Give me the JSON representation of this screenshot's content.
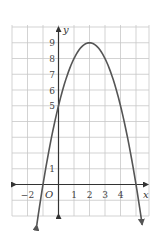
{
  "chart_data": {
    "type": "line",
    "title": "",
    "xlabel": "x",
    "ylabel": "y",
    "origin_label": "O",
    "xlim": [
      -3,
      6
    ],
    "ylim": [
      -2,
      10
    ],
    "grid": true,
    "x_tick_labels": [
      "−2",
      "1",
      "2",
      "3",
      "4"
    ],
    "y_tick_labels": [
      "1",
      "5",
      "6",
      "7",
      "8",
      "9"
    ],
    "series": [
      {
        "name": "y = -x^2 + 4x + 5",
        "equation": "y = -(x-2)^2 + 9",
        "vertex": [
          2,
          9
        ],
        "x_intercepts": [
          -1,
          5
        ],
        "y_intercept": 5,
        "x": [
          -1.4,
          -1,
          0,
          1,
          2,
          3,
          4,
          5,
          5.4
        ],
        "y": [
          -2.16,
          0,
          5,
          8,
          9,
          8,
          5,
          0,
          -2.16
        ],
        "arrows_at_ends": true
      }
    ],
    "colors": {
      "curve": "#555555",
      "axis": "#333333",
      "grid": "#c8c8c8"
    }
  }
}
